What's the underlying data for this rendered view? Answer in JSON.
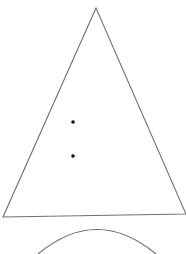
{
  "diagram": {
    "background": "#ffffff",
    "stroke_color": "#6e6e6e",
    "dot_color": "#111111",
    "triangle": {
      "apex": [
        96,
        8
      ],
      "bottom_left": [
        3,
        217
      ],
      "bottom_right": [
        186,
        214
      ]
    },
    "dots": [
      {
        "x": 73,
        "y": 122
      },
      {
        "x": 73,
        "y": 156
      }
    ],
    "arc": {
      "start": [
        38,
        254
      ],
      "control": [
        97,
        205
      ],
      "end": [
        156,
        254
      ]
    }
  }
}
